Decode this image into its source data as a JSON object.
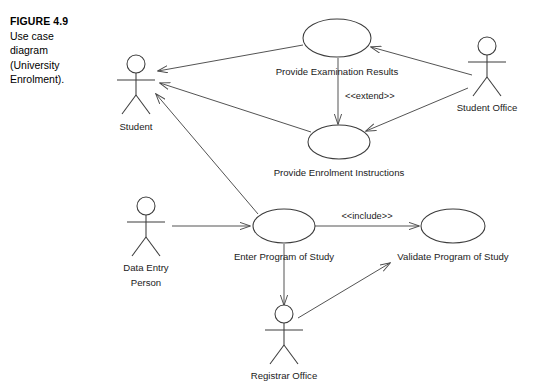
{
  "figure": {
    "number_label": "FIGURE 4.9",
    "caption_lines": [
      "Use case",
      "diagram",
      "(University",
      "Enrolment)."
    ]
  },
  "diagram": {
    "kind": "uml-use-case-diagram",
    "actors": [
      {
        "id": "student",
        "label": "Student",
        "label_lines": [
          "Student"
        ]
      },
      {
        "id": "student-office",
        "label": "Student Office",
        "label_lines": [
          "Student Office"
        ]
      },
      {
        "id": "data-entry-person",
        "label": "Data Entry Person",
        "label_lines": [
          "Data Entry",
          "Person"
        ]
      },
      {
        "id": "registrar-office",
        "label": "Registrar Office",
        "label_lines": [
          "Registrar Office"
        ]
      }
    ],
    "use_cases": [
      {
        "id": "provide-examination-results",
        "label": "Provide Examination Results"
      },
      {
        "id": "provide-enrolment-instructions",
        "label": "Provide Enrolment Instructions"
      },
      {
        "id": "enter-program-of-study",
        "label": "Enter Program of Study"
      },
      {
        "id": "validate-program-of-study",
        "label": "Validate Program of Study"
      }
    ],
    "stereotypes": [
      {
        "id": "extend",
        "label": "<<extend>>",
        "from": "provide-examination-results",
        "to": "provide-enrolment-instructions"
      },
      {
        "id": "include",
        "label": "<<include>>",
        "from": "enter-program-of-study",
        "to": "validate-program-of-study"
      }
    ],
    "colors": {
      "stroke": "#3c3c3c",
      "relation": "#4a4a4a",
      "text": "#1b1b1b",
      "background": "#ffffff"
    }
  }
}
